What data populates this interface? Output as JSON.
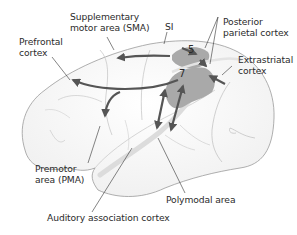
{
  "diagram": {
    "labels": {
      "sma_line1": "Supplementary",
      "sma_line2": "motor area (SMA)",
      "si": "SI",
      "prefrontal_line1": "Prefrontal",
      "prefrontal_line2": "cortex",
      "ppc_line1": "Posterior",
      "ppc_line2": "parietal cortex",
      "extrastriatal_line1": "Extrastriatal",
      "extrastriatal_line2": "cortex",
      "premotor_line1": "Premotor",
      "premotor_line2": "area (PMA)",
      "polymodal": "Polymodal area",
      "auditory": "Auditory association cortex"
    },
    "areas": {
      "area5": "5",
      "area7": "7"
    },
    "colors": {
      "outline": "#9a9a9a",
      "sulcus": "#b8b8b8",
      "area_fill": "#a9a9a9",
      "arrow": "#555555",
      "leader": "#333333",
      "text": "#2b2b2b"
    }
  }
}
